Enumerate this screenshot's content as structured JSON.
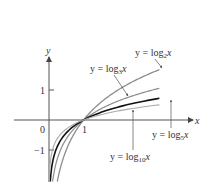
{
  "chart_data": {
    "type": "line",
    "title": "",
    "xlabel": "x",
    "ylabel": "y",
    "grid": false,
    "xlim": [
      0,
      3.5
    ],
    "ylim": [
      -2.8,
      1.8
    ],
    "x_ticks": [
      {
        "value": 0,
        "label": "0"
      },
      {
        "value": 1,
        "label": "1"
      }
    ],
    "y_ticks": [
      {
        "value": 1,
        "label": "1"
      },
      {
        "value": -1,
        "label": "-1"
      }
    ],
    "series": [
      {
        "name": "y = log2 x",
        "base": 2,
        "color": "#8c8c8c",
        "width": 1.3,
        "points": [
          [
            0.15,
            -2.74
          ],
          [
            0.25,
            -2
          ],
          [
            0.5,
            -1
          ],
          [
            1,
            0
          ],
          [
            2,
            1
          ],
          [
            3.2,
            1.68
          ]
        ]
      },
      {
        "name": "y = log3 x",
        "base": 3,
        "color": "#8c8c8c",
        "width": 1.2,
        "points": [
          [
            0.1,
            -2.1
          ],
          [
            0.25,
            -1.26
          ],
          [
            0.5,
            -0.63
          ],
          [
            1,
            0
          ],
          [
            2,
            0.63
          ],
          [
            3.2,
            1.06
          ]
        ]
      },
      {
        "name": "y = log5 x",
        "base": 5,
        "color": "#111111",
        "width": 1.6,
        "points": [
          [
            0.04,
            -2
          ],
          [
            0.1,
            -1.43
          ],
          [
            0.25,
            -0.86
          ],
          [
            0.5,
            -0.43
          ],
          [
            1,
            0
          ],
          [
            2,
            0.43
          ],
          [
            3.2,
            0.72
          ]
        ]
      },
      {
        "name": "y = log10 x",
        "base": 10,
        "color": "#aaaaaa",
        "width": 1.1,
        "points": [
          [
            0.01,
            -2
          ],
          [
            0.1,
            -1
          ],
          [
            0.25,
            -0.6
          ],
          [
            0.5,
            -0.3
          ],
          [
            1,
            0
          ],
          [
            2,
            0.3
          ],
          [
            3.2,
            0.51
          ]
        ]
      }
    ],
    "annotations": [
      {
        "text": "y = log2 x",
        "points_to": "log2"
      },
      {
        "text": "y = log3 x",
        "points_to": "log3"
      },
      {
        "text": "y = log5 x",
        "points_to": "log5"
      },
      {
        "text": "y = log10 x",
        "points_to": "log10"
      }
    ]
  },
  "labels": {
    "axis_x": "x",
    "axis_y": "y",
    "origin": "0",
    "tick_x1": "1",
    "tick_y1": "1",
    "tick_yneg1": "−1",
    "log2": {
      "pre": "y = log",
      "sub": "2",
      "post": "x"
    },
    "log3": {
      "pre": "y = log",
      "sub": "3",
      "post": "x"
    },
    "log5": {
      "pre": "y = log",
      "sub": "5",
      "post": "x"
    },
    "log10": {
      "pre": "y = log",
      "sub": "10",
      "post": "x"
    }
  }
}
